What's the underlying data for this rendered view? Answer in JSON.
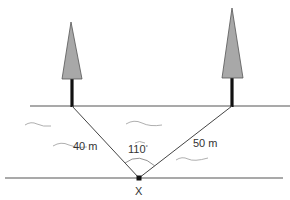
{
  "diagram": {
    "labels": {
      "left_distance": "40 m",
      "right_distance": "50 m",
      "angle": "110",
      "angle_unit": "°",
      "point": "X"
    },
    "measurements": {
      "left_distance_m": 40,
      "right_distance_m": 50,
      "angle_deg": 110
    },
    "colors": {
      "tree_crown": "#a8a8a8",
      "tree_trunk": "#111111",
      "lines": "#444444",
      "water_waves": "#9a9a9a",
      "text": "#333333"
    }
  }
}
